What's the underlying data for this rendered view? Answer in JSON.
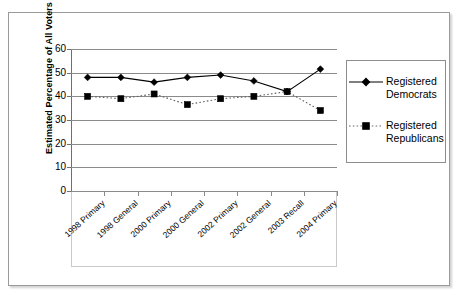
{
  "chart_data": {
    "type": "line",
    "title": "",
    "xlabel": "",
    "ylabel": "Estimated Percentage of All Voters",
    "categories": [
      "1998 Primary",
      "1998 General",
      "2000 Primary",
      "2000 General",
      "2002 Primary",
      "2002 General",
      "2003 Recall",
      "2004 Primary"
    ],
    "ylim": [
      0,
      60
    ],
    "yticks": [
      0,
      10,
      20,
      30,
      40,
      50,
      60
    ],
    "grid": true,
    "legend_position": "right",
    "series": [
      {
        "name": "Registered Democrats",
        "marker": "diamond",
        "line_style": "solid",
        "color": "#000000",
        "values": [
          48,
          48,
          46,
          48,
          49,
          46.5,
          42,
          51.5
        ]
      },
      {
        "name": "Registered Republicans",
        "marker": "square",
        "line_style": "dotted",
        "color": "#000000",
        "values": [
          40,
          39,
          41,
          36.5,
          39,
          40,
          42,
          34
        ]
      }
    ]
  },
  "legend": {
    "entries": [
      {
        "label_line1": "Registered",
        "label_line2": "Democrats"
      },
      {
        "label_line1": "Registered",
        "label_line2": "Republicans"
      }
    ]
  }
}
